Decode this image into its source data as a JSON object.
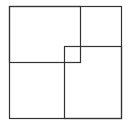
{
  "diagram": {
    "stroke_color": "#333333",
    "background": "#ffffff",
    "shapes": [
      {
        "name": "outer-square",
        "x": 9,
        "y": 6,
        "w": 112,
        "h": 112
      },
      {
        "name": "top-left-square",
        "x": 9,
        "y": 6,
        "w": 71,
        "h": 56
      },
      {
        "name": "bottom-right-square",
        "x": 64,
        "y": 46,
        "w": 57,
        "h": 72
      }
    ]
  }
}
